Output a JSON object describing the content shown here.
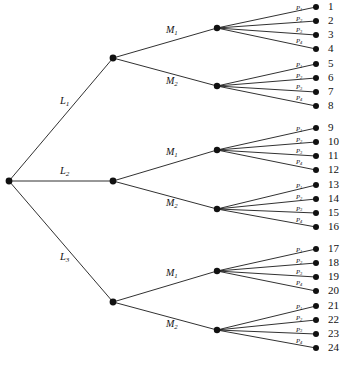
{
  "figure": {
    "type": "decision-tree-diagram",
    "background_color": "#ffffff",
    "line_color": "#1a1a1a",
    "node_color": "#111111",
    "width": 340,
    "height": 371
  },
  "chart_data": {
    "type": "diagram",
    "title": "",
    "tree": {
      "root": {
        "id": "root",
        "x": 9,
        "y": 181
      },
      "levels": [
        {
          "name": "L",
          "label_prefix": "L",
          "count": 3
        },
        {
          "name": "M",
          "label_prefix": "M",
          "count": 2
        },
        {
          "name": "P",
          "label_prefix": "P",
          "count": 4
        }
      ],
      "level1_labels": [
        "L",
        "L",
        "L"
      ],
      "level1_subs": [
        "1",
        "2",
        "3"
      ],
      "level2_labels": [
        "M",
        "M"
      ],
      "level2_subs": [
        "1",
        "2"
      ],
      "level3_labels": [
        "P",
        "P",
        "P",
        "P"
      ],
      "level3_subs": [
        "1",
        "2",
        "3",
        "4"
      ]
    },
    "level1_nodes": [
      {
        "label": "L",
        "sub": "1",
        "x": 113,
        "y": 58,
        "label_x": 60,
        "label_y": 102
      },
      {
        "label": "L",
        "sub": "2",
        "x": 113,
        "y": 181,
        "label_x": 60,
        "label_y": 172
      },
      {
        "label": "L",
        "sub": "3",
        "x": 113,
        "y": 302,
        "label_x": 60,
        "label_y": 258
      }
    ],
    "level2_nodes": [
      {
        "label": "M",
        "sub": "1",
        "x": 217,
        "y": 28,
        "parent": 0,
        "label_x": 166,
        "label_y": 31
      },
      {
        "label": "M",
        "sub": "2",
        "x": 217,
        "y": 86,
        "parent": 0,
        "label_x": 166,
        "label_y": 82
      },
      {
        "label": "M",
        "sub": "1",
        "x": 217,
        "y": 150,
        "parent": 1,
        "label_x": 166,
        "label_y": 153
      },
      {
        "label": "M",
        "sub": "2",
        "x": 217,
        "y": 209,
        "parent": 1,
        "label_x": 166,
        "label_y": 204
      },
      {
        "label": "M",
        "sub": "1",
        "x": 217,
        "y": 271,
        "parent": 2,
        "label_x": 166,
        "label_y": 274
      },
      {
        "label": "M",
        "sub": "2",
        "x": 217,
        "y": 330,
        "parent": 2,
        "label_x": 166,
        "label_y": 325
      }
    ],
    "leaf_x": 316,
    "leaf_number_x": 328,
    "leaf_label_x": 296,
    "leaves": [
      {
        "n": "1",
        "label": "P",
        "sub": "1",
        "y": 7,
        "parent": 0
      },
      {
        "n": "2",
        "label": "P",
        "sub": "2",
        "y": 21,
        "parent": 0
      },
      {
        "n": "3",
        "label": "P",
        "sub": "3",
        "y": 35,
        "parent": 0
      },
      {
        "n": "4",
        "label": "P",
        "sub": "4",
        "y": 49,
        "parent": 0
      },
      {
        "n": "5",
        "label": "P",
        "sub": "1",
        "y": 64,
        "parent": 1
      },
      {
        "n": "6",
        "label": "P",
        "sub": "2",
        "y": 78,
        "parent": 1
      },
      {
        "n": "7",
        "label": "P",
        "sub": "3",
        "y": 92,
        "parent": 1
      },
      {
        "n": "8",
        "label": "P",
        "sub": "4",
        "y": 106,
        "parent": 1
      },
      {
        "n": "9",
        "label": "P",
        "sub": "1",
        "y": 128,
        "parent": 2
      },
      {
        "n": "10",
        "label": "P",
        "sub": "2",
        "y": 142,
        "parent": 2
      },
      {
        "n": "11",
        "label": "P",
        "sub": "3",
        "y": 156,
        "parent": 2
      },
      {
        "n": "12",
        "label": "P",
        "sub": "4",
        "y": 170,
        "parent": 2
      },
      {
        "n": "13",
        "label": "P",
        "sub": "1",
        "y": 185,
        "parent": 3
      },
      {
        "n": "14",
        "label": "P",
        "sub": "2",
        "y": 199,
        "parent": 3
      },
      {
        "n": "15",
        "label": "P",
        "sub": "3",
        "y": 213,
        "parent": 3
      },
      {
        "n": "16",
        "label": "P",
        "sub": "4",
        "y": 227,
        "parent": 3
      },
      {
        "n": "17",
        "label": "P",
        "sub": "1",
        "y": 249,
        "parent": 4
      },
      {
        "n": "18",
        "label": "P",
        "sub": "2",
        "y": 263,
        "parent": 4
      },
      {
        "n": "19",
        "label": "P",
        "sub": "3",
        "y": 277,
        "parent": 4
      },
      {
        "n": "20",
        "label": "P",
        "sub": "4",
        "y": 291,
        "parent": 4
      },
      {
        "n": "21",
        "label": "P",
        "sub": "1",
        "y": 306,
        "parent": 5
      },
      {
        "n": "22",
        "label": "P",
        "sub": "2",
        "y": 320,
        "parent": 5
      },
      {
        "n": "23",
        "label": "P",
        "sub": "3",
        "y": 334,
        "parent": 5
      },
      {
        "n": "24",
        "label": "P",
        "sub": "4",
        "y": 348,
        "parent": 5
      }
    ]
  }
}
